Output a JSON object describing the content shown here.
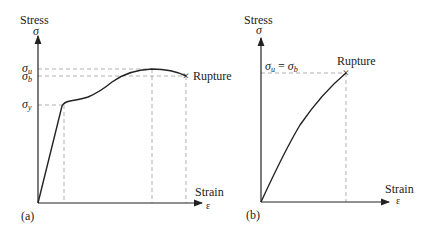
{
  "panel_a": {
    "tag": "(a)",
    "y_axis_label": "Stress",
    "y_axis_symbol": "σ",
    "x_axis_label": "Strain",
    "x_axis_symbol": "ε",
    "levels": [
      {
        "name": "sigma_u",
        "base": "σ",
        "sub": "u"
      },
      {
        "name": "sigma_b",
        "base": "σ",
        "sub": "b"
      },
      {
        "name": "sigma_y",
        "base": "σ",
        "sub": "y"
      }
    ],
    "annotation": "Rupture",
    "marker": "×"
  },
  "panel_b": {
    "tag": "(b)",
    "y_axis_label": "Stress",
    "y_axis_symbol": "σ",
    "x_axis_label": "Strain",
    "x_axis_symbol": "ε",
    "level_label": {
      "base1": "σ",
      "sub1": "u",
      "eq": " = ",
      "base2": "σ",
      "sub2": "b"
    },
    "annotation": "Rupture",
    "marker": "×"
  },
  "colors": {
    "curve": "#222222",
    "axis": "#222222",
    "dashed": "#a8a8a8"
  }
}
